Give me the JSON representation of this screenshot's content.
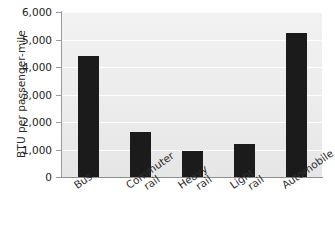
{
  "chart_data": {
    "type": "bar",
    "title": "",
    "subtitle": "",
    "xlabel": "",
    "ylabel": "BTU per passenger-mile",
    "categories": [
      "Bus",
      "Commuter rail",
      "Heavy rail",
      "Light rail",
      "Automobile"
    ],
    "category_lines": [
      [
        "Bus"
      ],
      [
        "Commuter",
        "rail"
      ],
      [
        "Heavy",
        "rail"
      ],
      [
        "Light",
        "rail"
      ],
      [
        "Automobile"
      ]
    ],
    "values": [
      4400,
      1620,
      950,
      1200,
      5250
    ],
    "ylim": [
      0,
      6000
    ],
    "ytick_values": [
      0,
      1000,
      2000,
      3000,
      4000,
      5000,
      6000
    ],
    "ytick_labels": [
      "0",
      "1,000",
      "2,000",
      "3,000",
      "4,000",
      "5,000",
      "6,000"
    ],
    "grid": true,
    "grid_axis": "y",
    "legend": false,
    "legend_position": "none",
    "bar_color": "#1b1b1b",
    "plot_background": "#eeeeee",
    "gridline_color": "#ffffff",
    "axis_color": "#9a9a9a",
    "label_rotation_deg": -35
  }
}
